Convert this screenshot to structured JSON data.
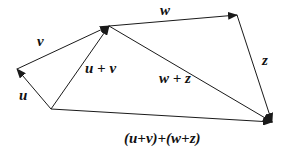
{
  "diagram": {
    "type": "vector-addition",
    "stroke_color": "#1a1a1a",
    "points": {
      "O": [
        51,
        109
      ],
      "A": [
        17,
        69
      ],
      "B": [
        109,
        26
      ],
      "C": [
        237,
        15
      ],
      "D": [
        272,
        122
      ]
    },
    "vectors": [
      {
        "id": "u",
        "from": "O",
        "to": "A",
        "label": "u"
      },
      {
        "id": "v",
        "from": "A",
        "to": "B",
        "label": "v"
      },
      {
        "id": "u_plus_v",
        "from": "O",
        "to": "B",
        "label": "u + v"
      },
      {
        "id": "w",
        "from": "B",
        "to": "C",
        "label": "w"
      },
      {
        "id": "z",
        "from": "C",
        "to": "D",
        "label": "z"
      },
      {
        "id": "w_plus_z",
        "from": "B",
        "to": "D",
        "label": "w + z"
      },
      {
        "id": "total",
        "from": "O",
        "to": "D",
        "label": "(u+v)+(w+z)"
      }
    ]
  },
  "labels": {
    "u": "u",
    "v": "v",
    "u_plus_v": "u + v",
    "w": "w",
    "z": "z",
    "w_plus_z": "w + z",
    "total": "(u+v)+(w+z)"
  }
}
